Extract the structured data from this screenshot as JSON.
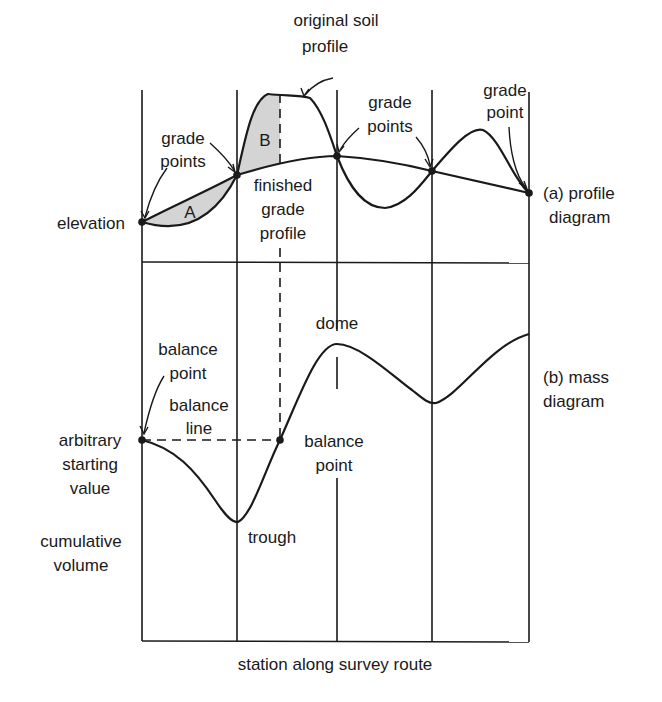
{
  "diagram": {
    "profile_panel": {
      "caption_line1": "(a) profile",
      "caption_line2": "diagram",
      "y_axis_label": "elevation",
      "area_labels": {
        "a": "A",
        "b": "B"
      },
      "annotations": {
        "grade_points_left_1": "grade",
        "grade_points_left_2": "points",
        "original_soil_1": "original soil",
        "original_soil_2": "profile",
        "grade_points_mid_1": "grade",
        "grade_points_mid_2": "points",
        "grade_point_right_1": "grade",
        "grade_point_right_2": "point",
        "finished_1": "finished",
        "finished_2": "grade",
        "finished_3": "profile"
      }
    },
    "mass_panel": {
      "caption_line1": "(b) mass",
      "caption_line2": "diagram",
      "y_axis_label_1": "cumulative",
      "y_axis_label_2": "volume",
      "annotations": {
        "balance_point_top_1": "balance",
        "balance_point_top_2": "point",
        "balance_line_1": "balance",
        "balance_line_2": "line",
        "arbitrary_1": "arbitrary",
        "arbitrary_2": "starting",
        "arbitrary_3": "value",
        "balance_point_right_1": "balance",
        "balance_point_right_2": "point",
        "dome": "dome",
        "trough": "trough"
      }
    },
    "x_axis_label": "station along survey route",
    "colors": {
      "ink": "#1a1a1a",
      "shade": "#d4d4d4",
      "background": "#ffffff"
    }
  }
}
